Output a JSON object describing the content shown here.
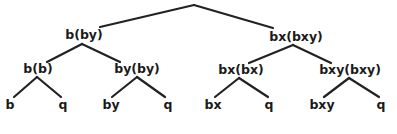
{
  "diagram": {
    "type": "binary-tree",
    "root": {
      "label": "",
      "children": [
        "b(by)",
        "bx(bxy)"
      ]
    },
    "level1": [
      {
        "label": "b(by)",
        "children": [
          "b(b)",
          "by(by)"
        ]
      },
      {
        "label": "bx(bxy)",
        "children": [
          "bx(bx)",
          "bxy(bxy)"
        ]
      }
    ],
    "level2": [
      {
        "label": "b(b)",
        "children": [
          "b",
          "q"
        ]
      },
      {
        "label": "by(by)",
        "children": [
          "by",
          "q"
        ]
      },
      {
        "label": "bx(bx)",
        "children": [
          "bx",
          "q"
        ]
      },
      {
        "label": "bxy(bxy)",
        "children": [
          "bxy",
          "q"
        ]
      }
    ],
    "leaves": [
      "b",
      "q",
      "by",
      "q",
      "bx",
      "q",
      "bxy",
      "q"
    ],
    "colors": {
      "line": "#222222",
      "text": "#1a1a1a",
      "background": "#ffffff"
    }
  }
}
